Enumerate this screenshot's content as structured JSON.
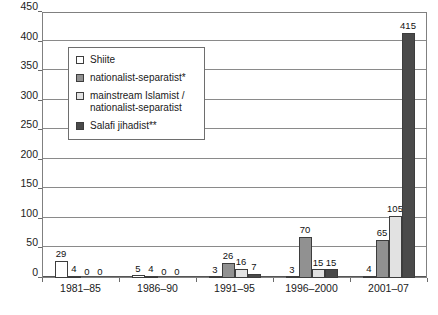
{
  "chart_data": {
    "type": "bar",
    "title": "",
    "xlabel": "",
    "ylabel": "",
    "ylim": [
      0,
      450
    ],
    "ytick_step": 50,
    "yticks": [
      0,
      50,
      100,
      150,
      200,
      250,
      300,
      350,
      400,
      450
    ],
    "grid": true,
    "legend_position": "inside-upper-left",
    "categories": [
      "1981–85",
      "1986–90",
      "1991–95",
      "1996–2000",
      "2001–07"
    ],
    "series": [
      {
        "name": "Shiite",
        "color": "#ffffff",
        "values": [
          29,
          5,
          3,
          3,
          4
        ],
        "labels": [
          "29",
          "5",
          "3",
          "3",
          "4"
        ]
      },
      {
        "name": "nationalist-separatist*",
        "color": "#919191",
        "values": [
          4,
          4,
          26,
          70,
          65
        ],
        "labels": [
          "4",
          "4",
          "26",
          "70",
          "65"
        ]
      },
      {
        "name": "mainstream Islamist /\nnationalist-separatist",
        "color": "#e2e2e2",
        "values": [
          0,
          0,
          16,
          15,
          105
        ],
        "labels": [
          "0",
          "0",
          "16",
          "15",
          "105"
        ]
      },
      {
        "name": "Salafi jihadist**",
        "color": "#4a4a4a",
        "values": [
          0,
          0,
          7,
          15,
          415
        ],
        "labels": [
          "0",
          "0",
          "7",
          "15",
          "415"
        ]
      }
    ]
  },
  "legend": {
    "entries": [
      {
        "label": "Shiite",
        "color": "#ffffff"
      },
      {
        "label": "nationalist-separatist*",
        "color": "#919191"
      },
      {
        "label": "mainstream Islamist /\nnationalist-separatist",
        "color": "#e2e2e2"
      },
      {
        "label": "Salafi jihadist**",
        "color": "#4a4a4a"
      }
    ]
  },
  "colors": {
    "grid": "#8a8a8a",
    "frame": "#808080",
    "bar_outline": "#3d3d3d",
    "text": "#1a1a1a"
  }
}
